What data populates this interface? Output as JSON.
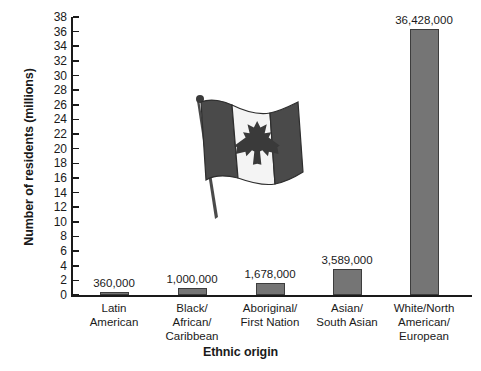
{
  "chart_data": {
    "type": "bar",
    "title": "",
    "xlabel": "Ethnic origin",
    "ylabel": "Number of residents (millions)",
    "categories": [
      "Latin American",
      "Black/ African/ Caribbean",
      "Aboriginal/ First Nation",
      "Asian/ South Asian",
      "White/North American/ European"
    ],
    "category_lines": [
      [
        "Latin",
        "American"
      ],
      [
        "Black/",
        "African/",
        "Caribbean"
      ],
      [
        "Aboriginal/",
        "First Nation"
      ],
      [
        "Asian/",
        "South Asian"
      ],
      [
        "White/North",
        "American/",
        "European"
      ]
    ],
    "values": [
      0.36,
      1.0,
      1.678,
      3.589,
      36.428
    ],
    "value_labels": [
      "360,000",
      "1,000,000",
      "1,678,000",
      "3,589,000",
      "36,428,000"
    ],
    "ylim": [
      0,
      38
    ],
    "ytick_step": 2,
    "yticks": [
      38,
      36,
      34,
      32,
      30,
      28,
      26,
      24,
      22,
      20,
      18,
      16,
      14,
      12,
      10,
      8,
      6,
      4,
      2,
      0
    ],
    "grid": false,
    "legend": "none",
    "bar_color": "#757575",
    "bar_edge_color": "#3d3d3d",
    "axis_color": "#1a1a1a"
  },
  "decoration": {
    "flag_name": "canadian-flag-illustration",
    "flag_alt": "Waving Canadian flag on a pole",
    "flag_band_color": "#4a4a4a",
    "flag_center_color": "#f2f2f2",
    "flag_leaf_color": "#3a3a3a",
    "flag_pole_color": "#4a4a4a"
  }
}
